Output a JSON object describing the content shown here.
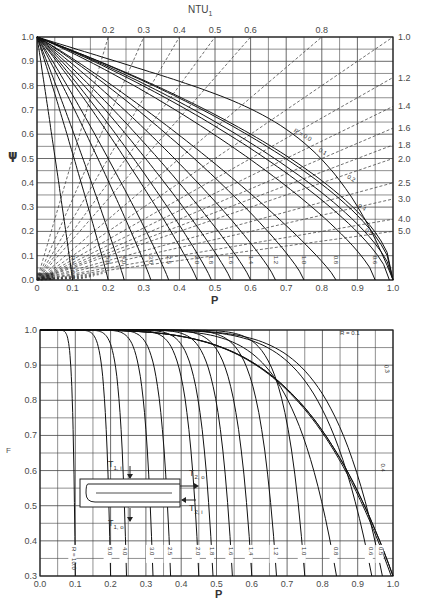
{
  "chart_data": [
    {
      "type": "line",
      "title": "",
      "xlabel": "P",
      "ylabel": "ψ",
      "top_axis_label": "NTU₁",
      "xlim": [
        0,
        1
      ],
      "ylim": [
        0,
        1
      ],
      "grid": true,
      "x_ticks": [
        "0",
        "0.1",
        "0.2",
        "0.3",
        "0.4",
        "0.5",
        "0.6",
        "0.7",
        "0.8",
        "0.9",
        "1.0"
      ],
      "y_ticks": [
        "0.0",
        "0.1",
        "0.2",
        "0.3",
        "0.4",
        "0.5",
        "0.6",
        "0.7",
        "0.8",
        "0.9",
        "1.0"
      ],
      "ntu_lines_top": [
        {
          "ntu": "0.2",
          "p_at_top": 0.2
        },
        {
          "ntu": "0.3",
          "p_at_top": 0.3
        },
        {
          "ntu": "0.4",
          "p_at_top": 0.4
        },
        {
          "ntu": "0.5",
          "p_at_top": 0.5
        },
        {
          "ntu": "0.6",
          "p_at_top": 0.6
        },
        {
          "ntu": "0.8",
          "p_at_top": 0.8
        }
      ],
      "ntu_lines_right": [
        {
          "ntu": "1.0",
          "psi_at_right": 1.0
        },
        {
          "ntu": "1.2",
          "psi_at_right": 0.83
        },
        {
          "ntu": "1.4",
          "psi_at_right": 0.71
        },
        {
          "ntu": "1.6",
          "psi_at_right": 0.625
        },
        {
          "ntu": "1.8",
          "psi_at_right": 0.555
        },
        {
          "ntu": "2.0",
          "psi_at_right": 0.5
        },
        {
          "ntu": "2.5",
          "psi_at_right": 0.4
        },
        {
          "ntu": "3.0",
          "psi_at_right": 0.333
        },
        {
          "ntu": "4.0",
          "psi_at_right": 0.25
        },
        {
          "ntu": "5.0",
          "psi_at_right": 0.2
        }
      ],
      "series": [
        {
          "name": "R = 0.0",
          "label": "R = 0.0",
          "p_end": 1.0
        },
        {
          "name": "R = 0.1",
          "label": "0.1",
          "p_end": 1.0
        },
        {
          "name": "R = 0.2",
          "label": "0.2",
          "p_end": 1.0
        },
        {
          "name": "R = 0.4",
          "label": "0.4",
          "p_end": 1.0
        },
        {
          "name": "R = 0.5",
          "label": "0.5",
          "p_end": 0.99
        },
        {
          "name": "R = 0.6",
          "label": "0.6",
          "p_end": 0.95
        },
        {
          "name": "R = 0.8",
          "label": "0.8",
          "p_end": 0.84
        },
        {
          "name": "R = 1.0",
          "label": "1.0",
          "p_end": 0.75
        },
        {
          "name": "R = 1.2",
          "label": "1.2",
          "p_end": 0.67
        },
        {
          "name": "R = 1.4",
          "label": "1.4",
          "p_end": 0.6
        },
        {
          "name": "R = 1.6",
          "label": "1.6",
          "p_end": 0.545
        },
        {
          "name": "R = 1.8",
          "label": "1.8",
          "p_end": 0.49
        },
        {
          "name": "R = 2.0",
          "label": "2.0",
          "p_end": 0.45
        },
        {
          "name": "R = 2.5",
          "label": "2.5",
          "p_end": 0.37
        },
        {
          "name": "R = 3.0",
          "label": "3.0",
          "p_end": 0.32
        },
        {
          "name": "R = 4.0",
          "label": "4.0",
          "p_end": 0.245
        },
        {
          "name": "R = 5.0",
          "label": "5.0",
          "p_end": 0.2
        },
        {
          "name": "R = 10.0",
          "label": "R = 10.0",
          "p_end": 0.1
        }
      ]
    },
    {
      "type": "line",
      "title": "",
      "xlabel": "P",
      "ylabel": "F",
      "xlim": [
        0,
        1
      ],
      "ylim": [
        0.3,
        1.0
      ],
      "grid": true,
      "x_ticks": [
        "0.0",
        "0.1",
        "0.2",
        "0.3",
        "0.4",
        "0.5",
        "0.6",
        "0.7",
        "0.8",
        "0.9",
        "1.0"
      ],
      "y_ticks": [
        "0.3",
        "0.4",
        "0.5",
        "0.6",
        "0.7",
        "0.8",
        "0.9",
        "1.0"
      ],
      "series": [
        {
          "name": "R = 0.1",
          "label": "R = 0.1",
          "p_asymptote": 1.0
        },
        {
          "name": "R = 0.3",
          "label": "0.3",
          "p_asymptote": 1.0
        },
        {
          "name": "R = 0.4",
          "label": "0.4",
          "p_asymptote": 0.995
        },
        {
          "name": "R = 0.5",
          "label": "0.5",
          "p_asymptote": 0.97
        },
        {
          "name": "R = 0.6",
          "label": "0.6",
          "p_asymptote": 0.94
        },
        {
          "name": "R = 0.8",
          "label": "0.8",
          "p_asymptote": 0.84
        },
        {
          "name": "R = 1.0",
          "label": "1.0",
          "p_asymptote": 0.75
        },
        {
          "name": "R = 1.2",
          "label": "1.2",
          "p_asymptote": 0.67
        },
        {
          "name": "R = 1.4",
          "label": "1.4",
          "p_asymptote": 0.6
        },
        {
          "name": "R = 1.6",
          "label": "1.6",
          "p_asymptote": 0.545
        },
        {
          "name": "R = 1.8",
          "label": "1.8",
          "p_asymptote": 0.49
        },
        {
          "name": "R = 2.0",
          "label": "2.0",
          "p_asymptote": 0.45
        },
        {
          "name": "R = 2.5",
          "label": "2.5",
          "p_asymptote": 0.37
        },
        {
          "name": "R = 3.0",
          "label": "3.0",
          "p_asymptote": 0.32
        },
        {
          "name": "R = 4.0",
          "label": "4.0",
          "p_asymptote": 0.245
        },
        {
          "name": "R = 5.0",
          "label": "5.0",
          "p_asymptote": 0.2
        },
        {
          "name": "R = 10.0",
          "label": "R = 10.0",
          "p_asymptote": 0.1
        }
      ],
      "inset_diagram": {
        "labels": [
          "T1, i",
          "T1, o",
          "T2, o",
          "T2, i"
        ]
      }
    }
  ],
  "labels": {
    "top_ntu": "NTU",
    "top_ntu_sub": "1",
    "psi": "ψ",
    "p": "P",
    "f": "F",
    "t1i": "T",
    "t1i_sub": "1, i",
    "t1o": "T",
    "t1o_sub": "1, o",
    "t2o": "T",
    "t2o_sub": "2, o",
    "t2i": "T",
    "t2i_sub": "2, i"
  }
}
